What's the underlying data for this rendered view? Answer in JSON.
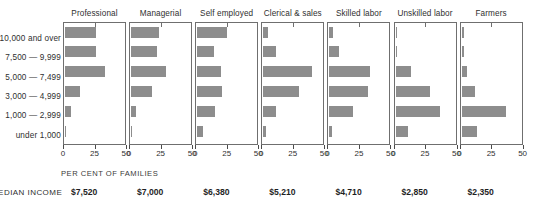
{
  "chart_data": {
    "type": "bar",
    "title": "",
    "subtitle": "",
    "orientation": "horizontal",
    "layout": "small-multiples",
    "xlabel": "PER CENT OF FAMILIES",
    "ylabel": "",
    "xlim": [
      0,
      50
    ],
    "xticks": [
      0,
      25,
      50
    ],
    "xtick_labels": [
      "0",
      "25",
      "50"
    ],
    "grid": false,
    "legend": null,
    "bar_color": "#8d8d8d",
    "categories": [
      "10,000 and over",
      "7,500 — 9,999",
      "5,000 — 7,499",
      "3,000 — 4,999",
      "1,000 — 2,999",
      "under 1,000"
    ],
    "series": [
      {
        "name": "Professional",
        "values": [
          26,
          26,
          34,
          13,
          5,
          1
        ]
      },
      {
        "name": "Managerial",
        "values": [
          24,
          22,
          30,
          18,
          4,
          1
        ]
      },
      {
        "name": "Self employed",
        "values": [
          25,
          14,
          20,
          21,
          15,
          5
        ]
      },
      {
        "name": "Clerical & sales",
        "values": [
          4,
          11,
          41,
          30,
          11,
          2
        ]
      },
      {
        "name": "Skilled labor",
        "values": [
          3,
          8,
          34,
          33,
          20,
          2
        ]
      },
      {
        "name": "Unskilled labor",
        "values": [
          1,
          1,
          13,
          29,
          38,
          11
        ]
      },
      {
        "name": "Farmers",
        "values": [
          2,
          2,
          5,
          11,
          38,
          13
        ]
      }
    ],
    "annotations": {
      "median_income_label": "MEDIAN INCOME",
      "median_income": [
        "$7,520",
        "$7,000",
        "$6,380",
        "$5,210",
        "$4,710",
        "$2,850",
        "$2,350"
      ]
    }
  },
  "footer": {
    "axis_caption": "PER CENT OF FAMILIES",
    "median_income_label": "MEDIAN INCOME"
  }
}
